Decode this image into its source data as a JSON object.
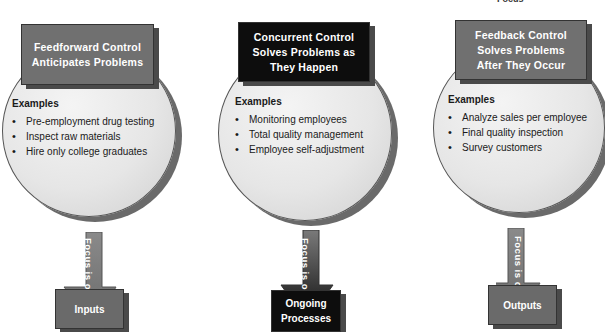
{
  "top_fragment": "Focus",
  "columns": [
    {
      "id": "feedforward",
      "title_lines": [
        "Feedforward Control",
        "Anticipates Problems"
      ],
      "examples_header": "Examples",
      "examples": [
        "Pre-employment drug testing",
        "Inspect raw materials",
        "Hire only college graduates"
      ],
      "arrow_label": "Focus is on",
      "focus": [
        "Inputs"
      ],
      "title_color": "#707070",
      "focus_color": "#6a6a6a"
    },
    {
      "id": "concurrent",
      "title_lines": [
        "Concurrent Control",
        "Solves Problems as",
        "They Happen"
      ],
      "examples_header": "Examples",
      "examples": [
        "Monitoring employees",
        "Total quality management",
        "Employee self-adjustment"
      ],
      "arrow_label": "Focus is on",
      "focus": [
        "Ongoing",
        "Processes"
      ],
      "title_color": "#0d0d0d",
      "focus_color": "#0d0d0d"
    },
    {
      "id": "feedback",
      "title_lines": [
        "Feedback Control",
        "Solves Problems",
        "After They Occur"
      ],
      "examples_header": "Examples",
      "examples": [
        "Analyze sales per employee",
        "Final quality inspection",
        "Survey customers"
      ],
      "arrow_label": "Focus is on",
      "focus": [
        "Outputs"
      ],
      "title_color": "#707070",
      "focus_color": "#6a6a6a"
    }
  ]
}
